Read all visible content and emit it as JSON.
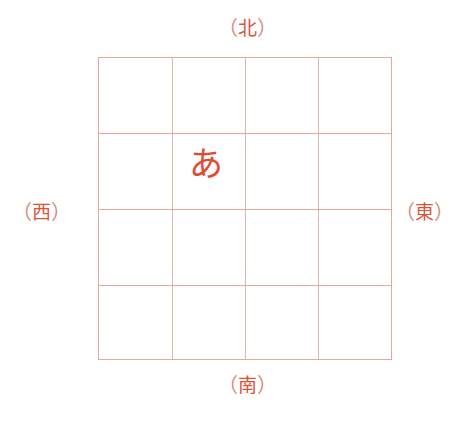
{
  "directions": {
    "north": {
      "open": "（",
      "char": "北",
      "close": "）"
    },
    "south": {
      "open": "（",
      "char": "南",
      "close": "）"
    },
    "west": {
      "open": "（",
      "char": "西",
      "close": "）"
    },
    "east": {
      "open": "（",
      "char": "東",
      "close": "）"
    }
  },
  "grid": {
    "rows": 4,
    "cols": 4,
    "line_color": "#e8a898"
  },
  "cell_character": {
    "row": 2,
    "col": 2,
    "char": "あ",
    "color": "#e04b33"
  }
}
